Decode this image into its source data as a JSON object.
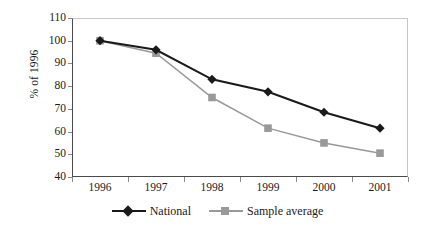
{
  "chart_data": {
    "type": "line",
    "title": "",
    "xlabel": "",
    "ylabel": "% of 1996",
    "categories": [
      "1996",
      "1997",
      "1998",
      "1999",
      "2000",
      "2001"
    ],
    "series": [
      {
        "name": "National",
        "marker": "diamond",
        "color": "#1a1a1a",
        "values": [
          100,
          96,
          83,
          77.5,
          68.5,
          61.5
        ]
      },
      {
        "name": "Sample average",
        "marker": "square",
        "color": "#999999",
        "values": [
          100,
          94.5,
          75,
          61.5,
          55,
          50.5
        ]
      }
    ],
    "ylim": [
      40,
      110
    ],
    "ytick_step": 10,
    "yticks": [
      110,
      100,
      90,
      80,
      70,
      60,
      50,
      40
    ],
    "grid": false,
    "legend_position": "bottom"
  },
  "legend": {
    "entries": [
      {
        "label": "National"
      },
      {
        "label": "Sample average"
      }
    ]
  }
}
